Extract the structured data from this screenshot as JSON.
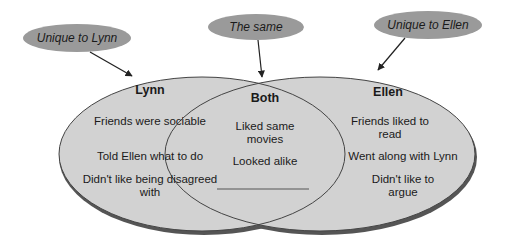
{
  "callouts": {
    "left": "Unique to Lynn",
    "middle": "The same",
    "right": "Unique to Ellen"
  },
  "sets": {
    "left": {
      "title": "Lynn",
      "items": [
        "Friends were sociable",
        "Told Ellen what to do",
        "Didn't like being disagreed with"
      ]
    },
    "middle": {
      "title": "Both",
      "items": [
        "Liked same movies",
        "Looked alike"
      ],
      "blank_line": true
    },
    "right": {
      "title": "Ellen",
      "items": [
        "Friends liked to read",
        "Went along with Lynn",
        "Didn't like to argue"
      ]
    }
  },
  "colors": {
    "fill": "#d2d2d2",
    "callout_fill": "#9a9a9a",
    "stroke": "#444444"
  }
}
